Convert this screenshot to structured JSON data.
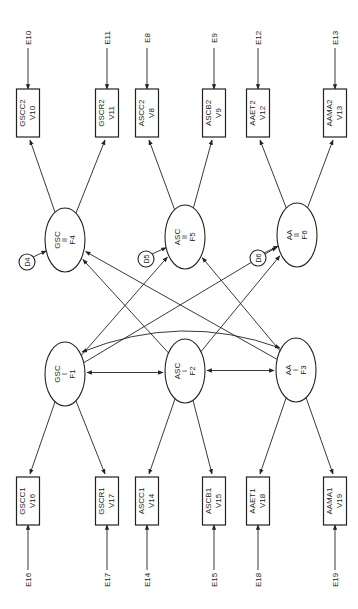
{
  "diagram": {
    "type": "structural-equation-model",
    "orientation": "rotated-90",
    "factors": [
      {
        "id": "F1",
        "name": "GSC",
        "time": "I",
        "label": "F1"
      },
      {
        "id": "F2",
        "name": "ASC",
        "time": "I",
        "label": "F2"
      },
      {
        "id": "F3",
        "name": "AA",
        "time": "I",
        "label": "F3"
      },
      {
        "id": "F4",
        "name": "GSC",
        "time": "II",
        "label": "F4",
        "disturbance": "D4"
      },
      {
        "id": "F5",
        "name": "ASC",
        "time": "II",
        "label": "F5",
        "disturbance": "D5"
      },
      {
        "id": "F6",
        "name": "AA",
        "time": "II",
        "label": "F6",
        "disturbance": "D6"
      }
    ],
    "indicators_top": [
      {
        "name": "GSCC2",
        "var": "V10",
        "error": "E10",
        "factor": "F4"
      },
      {
        "name": "GSCR2",
        "var": "V11",
        "error": "E11",
        "factor": "F4"
      },
      {
        "name": "ASCC2",
        "var": "V8",
        "error": "E8",
        "factor": "F5"
      },
      {
        "name": "ASCB2",
        "var": "V9",
        "error": "E9",
        "factor": "F5"
      },
      {
        "name": "AAET2",
        "var": "V12",
        "error": "E12",
        "factor": "F6"
      },
      {
        "name": "AAMA2",
        "var": "V13",
        "error": "E13",
        "factor": "F6"
      }
    ],
    "indicators_bottom": [
      {
        "name": "GSCC1",
        "var": "V16",
        "error": "E16",
        "factor": "F1"
      },
      {
        "name": "GSCR1",
        "var": "V17",
        "error": "E17",
        "factor": "F1"
      },
      {
        "name": "ASCC1",
        "var": "V14",
        "error": "E14",
        "factor": "F2"
      },
      {
        "name": "ASCB1",
        "var": "V15",
        "error": "E15",
        "factor": "F2"
      },
      {
        "name": "AAET1",
        "var": "V18",
        "error": "E18",
        "factor": "F3"
      },
      {
        "name": "AAMA1",
        "var": "V19",
        "error": "E19",
        "factor": "F3"
      }
    ],
    "cross_paths": [
      {
        "from": "F1",
        "to": "F5"
      },
      {
        "from": "F1",
        "to": "F6"
      },
      {
        "from": "F2",
        "to": "F4"
      },
      {
        "from": "F2",
        "to": "F6"
      },
      {
        "from": "F3",
        "to": "F4"
      },
      {
        "from": "F3",
        "to": "F5"
      }
    ],
    "correlations": [
      {
        "a": "F1",
        "b": "F2"
      },
      {
        "a": "F2",
        "b": "F3"
      },
      {
        "a": "F1",
        "b": "F3"
      }
    ]
  }
}
